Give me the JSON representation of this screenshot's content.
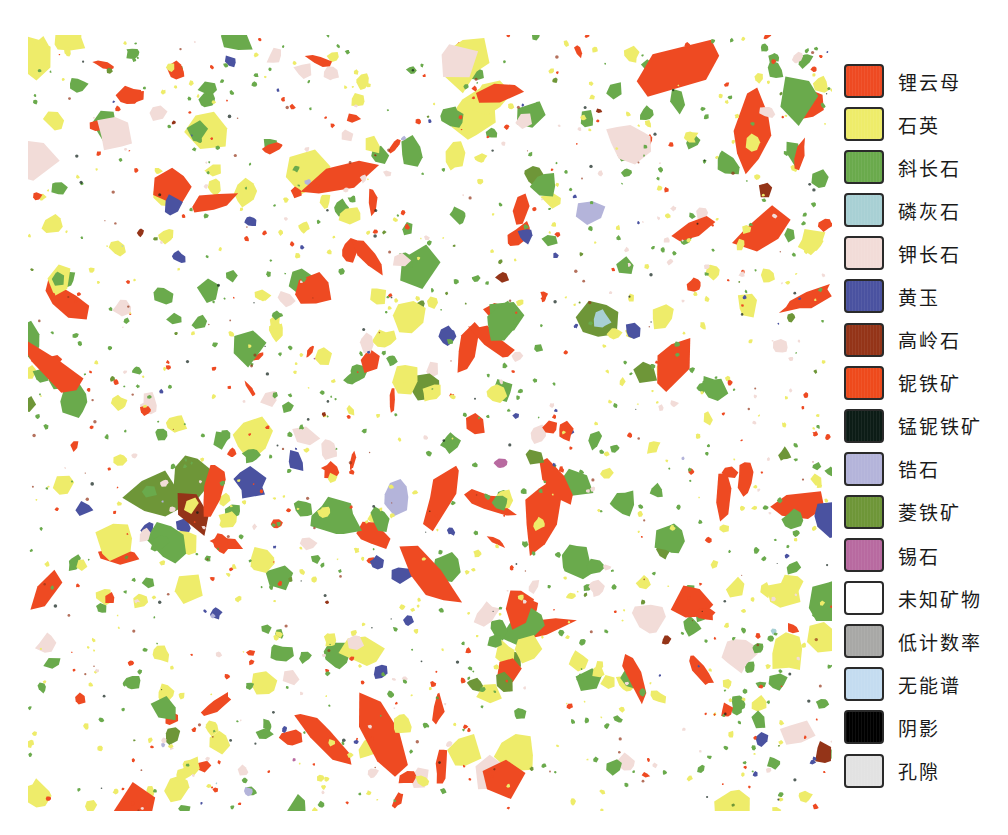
{
  "legend": {
    "items": [
      {
        "label": "锂云母",
        "color": "#ee4a22"
      },
      {
        "label": "石英",
        "color": "#eeec6a"
      },
      {
        "label": "斜长石",
        "color": "#6aaa4c"
      },
      {
        "label": "磷灰石",
        "color": "#a8d0d4"
      },
      {
        "label": "钾长石",
        "color": "#f2dcd8"
      },
      {
        "label": "黄玉",
        "color": "#4a52a0"
      },
      {
        "label": "高岭石",
        "color": "#943418"
      },
      {
        "label": "铌铁矿",
        "color": "#ee4a1c"
      },
      {
        "label": "锰铌铁矿",
        "color": "#0c1c16"
      },
      {
        "label": "锆石",
        "color": "#b4b4da"
      },
      {
        "label": "菱铁矿",
        "color": "#6e9638"
      },
      {
        "label": "锡石",
        "color": "#b86aa0"
      },
      {
        "label": "未知矿物",
        "color": "#ffffff"
      },
      {
        "label": "低计数率",
        "color": "#a8a8a6"
      },
      {
        "label": "无能谱",
        "color": "#c4dcf0"
      },
      {
        "label": "阴影",
        "color": "#000000"
      },
      {
        "label": "孔隙",
        "color": "#e2e2e2"
      }
    ]
  },
  "mosaic": {
    "background": "#ffffff",
    "tile_rows": 9,
    "tile_cols": 3
  }
}
